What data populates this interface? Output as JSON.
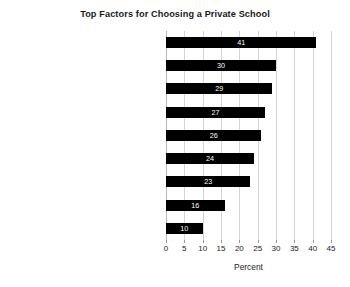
{
  "chart_data": {
    "type": "bar",
    "orientation": "horizontal",
    "title": "Top Factors for Choosing a Private School",
    "xlabel": "Percent",
    "ylabel": "",
    "xlim": [
      0,
      45
    ],
    "xticks": [
      0,
      5,
      10,
      15,
      20,
      25,
      30,
      35,
      40,
      45
    ],
    "grid": "vertical",
    "legend": null,
    "bar_color": "#000000",
    "value_label_color": "#ffffff",
    "categories": [
      "Academic reputation",
      "Safety",
      "Instruction in character and values",
      "School discipline",
      "Class size",
      "Amount of individual attention",
      "Extracurriculars",
      "School location",
      "Test scores"
    ],
    "values": [
      41,
      30,
      29,
      27,
      26,
      24,
      23,
      16,
      10
    ]
  }
}
